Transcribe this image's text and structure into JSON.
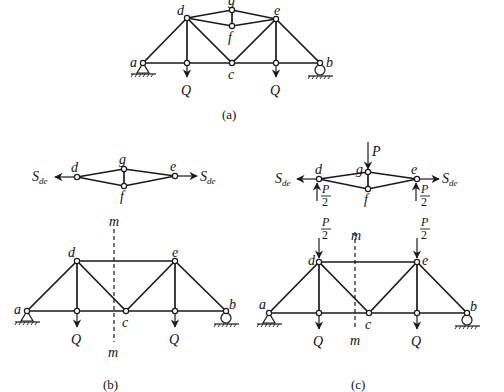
{
  "figure": {
    "panels": [
      {
        "id": "a",
        "caption": "(a)",
        "node_labels": {
          "a": "a",
          "b": "b",
          "c": "c",
          "d": "d",
          "e": "e",
          "f": "f",
          "g": "g"
        },
        "loads": [
          {
            "label": "Q",
            "at": "below-d"
          },
          {
            "label": "Q",
            "at": "below-e"
          }
        ]
      },
      {
        "id": "b",
        "caption": "(b)",
        "subsystem": {
          "node_labels": {
            "d": "d",
            "e": "e",
            "f": "f",
            "g": "g"
          },
          "force_left": "S",
          "force_left_sub": "de",
          "force_right": "S",
          "force_right_sub": "de"
        },
        "main": {
          "node_labels": {
            "a": "a",
            "b": "b",
            "c": "c",
            "d": "d",
            "e": "e"
          },
          "section_label_top": "m",
          "section_label_bottom": "m",
          "loads": [
            {
              "label": "Q"
            },
            {
              "label": "Q"
            }
          ]
        }
      },
      {
        "id": "c",
        "caption": "(c)",
        "subsystem": {
          "node_labels": {
            "d": "d",
            "e": "e",
            "f": "f",
            "g": "g"
          },
          "force_left": "S",
          "force_left_sub": "de",
          "force_right": "S",
          "force_right_sub": "de",
          "top_load": "P",
          "reaction_num": "P",
          "reaction_den": "2"
        },
        "main": {
          "node_labels": {
            "a": "a",
            "b": "b",
            "c": "c",
            "d": "d",
            "e": "e"
          },
          "section_label_top": "m",
          "section_label_bottom": "m",
          "applied_num": "P",
          "applied_den": "2",
          "loads": [
            {
              "label": "Q"
            },
            {
              "label": "Q"
            }
          ]
        }
      }
    ]
  }
}
